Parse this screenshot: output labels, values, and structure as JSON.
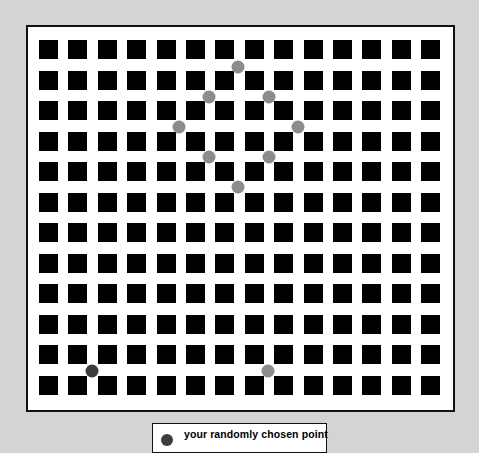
{
  "grid": {
    "columns": 14,
    "rows": 12,
    "origin_x": 39,
    "origin_y": 40,
    "pitch_x": 29.4,
    "pitch_y": 30.5,
    "square_size": 19,
    "square_color": "#000000",
    "background_color": "#ffffff",
    "border_color": "#111111"
  },
  "points": {
    "highlighted": [
      {
        "x": 238,
        "y": 67
      },
      {
        "x": 209,
        "y": 97
      },
      {
        "x": 269,
        "y": 97
      },
      {
        "x": 179,
        "y": 127
      },
      {
        "x": 298,
        "y": 127
      },
      {
        "x": 209,
        "y": 157
      },
      {
        "x": 269,
        "y": 157
      },
      {
        "x": 238,
        "y": 187
      },
      {
        "x": 268,
        "y": 371
      }
    ],
    "highlighted_color": "#8c8c8c",
    "chosen": {
      "x": 92,
      "y": 371
    },
    "chosen_color": "#3c3c3c"
  },
  "legend": {
    "label": "your randomly chosen point",
    "dot_color": "#3c3c3c"
  },
  "page_background": "#d4d4d4"
}
